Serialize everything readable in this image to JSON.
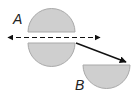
{
  "diagram": {
    "type": "geometry-transformation",
    "colors": {
      "shape_fill": "#cfcfcf",
      "shape_stroke": "#a9a9a9",
      "line": "#111111",
      "background": "#ffffff"
    },
    "labels": {
      "a": "A",
      "b": "B"
    },
    "shapes": [
      {
        "name": "semicircle-a-top",
        "orientation": "dome-up",
        "cx": 51.5,
        "baseline_y": 32,
        "radius": 23.5
      },
      {
        "name": "semicircle-reflected",
        "orientation": "dome-down",
        "cx": 51.5,
        "baseline_y": 43,
        "radius": 23.5
      },
      {
        "name": "semicircle-b",
        "orientation": "dome-down",
        "cx": 106.5,
        "baseline_y": 65,
        "radius": 23.5
      }
    ],
    "lines": [
      {
        "name": "reflection-line",
        "style": "dashed",
        "arrows": "both",
        "x1": 7,
        "y1": 37.5,
        "x2": 101,
        "y2": 37.5
      },
      {
        "name": "translation-arrow",
        "style": "solid",
        "arrows": "end",
        "x1": 76,
        "y1": 43,
        "x2": 127,
        "y2": 62
      }
    ]
  }
}
